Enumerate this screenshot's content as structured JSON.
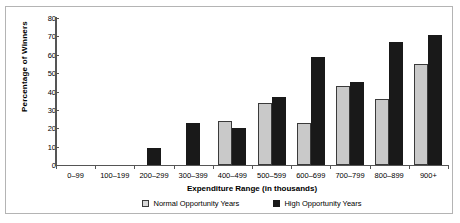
{
  "chart_data": {
    "type": "bar",
    "title": "",
    "xlabel": "Expenditure Range (in thousands)",
    "ylabel": "Percentage of Winners",
    "categories": [
      "0–99",
      "100–199",
      "200–299",
      "300–399",
      "400–499",
      "500–599",
      "600–699",
      "700–799",
      "800–899",
      "900+"
    ],
    "series": [
      {
        "name": "Normal Opportunity Years",
        "color": "#c9c9c9",
        "values": [
          0,
          0,
          0,
          0,
          24,
          34,
          23,
          43,
          36,
          55
        ]
      },
      {
        "name": "High Opportunity Years",
        "color": "#191919",
        "values": [
          0,
          0,
          9,
          23,
          20,
          37,
          59,
          45,
          67,
          71
        ]
      }
    ],
    "ylim": [
      0,
      80
    ],
    "yticks": [
      0,
      10,
      20,
      30,
      40,
      50,
      60,
      70,
      80
    ],
    "ytick_labels": [
      "0",
      "10",
      "20",
      "30",
      "40",
      "50",
      "60",
      "70",
      "80"
    ],
    "grid": false,
    "legend_position": "bottom"
  },
  "legend": [
    {
      "label": "Normal Opportunity Years",
      "swatch": "normal"
    },
    {
      "label": "High Opportunity Years",
      "swatch": "high"
    }
  ]
}
